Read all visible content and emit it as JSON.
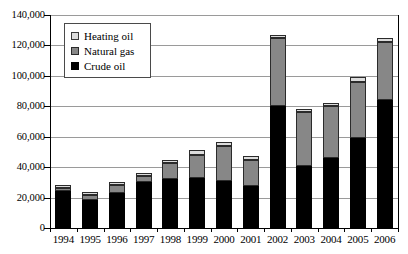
{
  "chart_data": {
    "type": "bar",
    "stacked": true,
    "title": "",
    "xlabel": "",
    "ylabel": "",
    "ylim": [
      0,
      140000
    ],
    "yticks": [
      "0",
      "20,000",
      "40,000",
      "60,000",
      "80,000",
      "100,000",
      "120,000",
      "140,000"
    ],
    "ytick_values": [
      0,
      20000,
      40000,
      60000,
      80000,
      100000,
      120000,
      140000
    ],
    "grid": true,
    "legend_position": "top-left",
    "categories": [
      "1994",
      "1995",
      "1996",
      "1997",
      "1998",
      "1999",
      "2000",
      "2001",
      "2002",
      "2003",
      "2004",
      "2005",
      "2006"
    ],
    "series": [
      {
        "name": "Crude oil",
        "color": "#000000",
        "values": [
          24000,
          18500,
          23000,
          30000,
          32000,
          33000,
          31000,
          27500,
          80000,
          41000,
          46000,
          59000,
          84000
        ]
      },
      {
        "name": "Natural gas",
        "color": "#878787",
        "values": [
          2500,
          3000,
          5500,
          4000,
          11000,
          15000,
          23000,
          17000,
          45000,
          35000,
          34000,
          37000,
          38000
        ]
      },
      {
        "name": "Heating oil",
        "color": "#dcdcdc",
        "values": [
          2000,
          2000,
          2000,
          2000,
          2000,
          3000,
          2500,
          2500,
          2000,
          2000,
          2000,
          3000,
          3000
        ]
      }
    ],
    "totals": [
      28500,
      23500,
      30500,
      36000,
      45000,
      51000,
      56500,
      47000,
      127000,
      78000,
      82000,
      99000,
      125000
    ]
  },
  "legend": {
    "items": [
      {
        "label": "Heating oil",
        "swatch": "heat"
      },
      {
        "label": "Natural gas",
        "swatch": "gas"
      },
      {
        "label": "Crude oil",
        "swatch": "crude"
      }
    ]
  }
}
